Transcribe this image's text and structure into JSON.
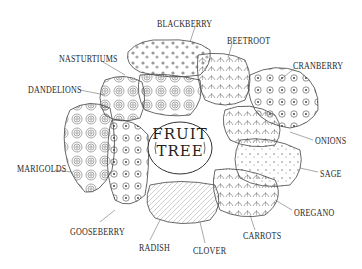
{
  "diagram": {
    "title_line1": "FRUIT",
    "title_line2": "TREE",
    "style": "black-and-white line art, fruit tree guild planting diagram",
    "colors": {
      "ink": "#2a2a2a",
      "background": "#ffffff"
    },
    "labels": [
      {
        "id": "blackberry",
        "text": "BLACKBERRY",
        "x": 157,
        "y": 18
      },
      {
        "id": "beetroot",
        "text": "BEETROOT",
        "x": 227,
        "y": 35
      },
      {
        "id": "nasturtiums",
        "text": "NASTURTIUMS",
        "x": 59,
        "y": 53
      },
      {
        "id": "cranberry",
        "text": "CRANBERRY",
        "x": 293,
        "y": 60
      },
      {
        "id": "dandelions",
        "text": "DANDELIONS",
        "x": 28,
        "y": 84
      },
      {
        "id": "onions",
        "text": "ONIONS",
        "x": 315,
        "y": 135
      },
      {
        "id": "marigolds",
        "text": "MARIGOLDS",
        "x": 17,
        "y": 163
      },
      {
        "id": "sage",
        "text": "SAGE",
        "x": 320,
        "y": 168
      },
      {
        "id": "oregano",
        "text": "OREGANO",
        "x": 294,
        "y": 207
      },
      {
        "id": "gooseberry",
        "text": "GOOSEBERRY",
        "x": 70,
        "y": 226
      },
      {
        "id": "carrots",
        "text": "CARROTS",
        "x": 243,
        "y": 230
      },
      {
        "id": "radish",
        "text": "RADISH",
        "x": 139,
        "y": 242
      },
      {
        "id": "clover",
        "text": "CLOVER",
        "x": 193,
        "y": 245
      }
    ]
  }
}
